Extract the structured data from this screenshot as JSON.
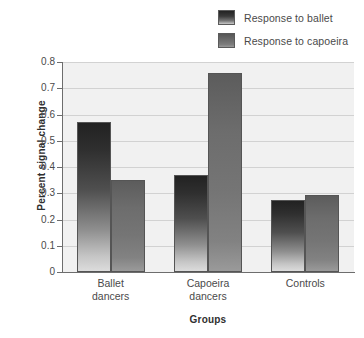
{
  "chart_data": {
    "type": "bar",
    "title": "",
    "xlabel": "Groups",
    "ylabel": "Percent signal change",
    "categories": [
      "Ballet dancers",
      "Capoeira dancers",
      "Controls"
    ],
    "category_lines": [
      [
        "Ballet",
        "dancers"
      ],
      [
        "Capoeira",
        "dancers"
      ],
      [
        "Controls"
      ]
    ],
    "series": [
      {
        "name": "Response to ballet",
        "values": [
          0.57,
          0.37,
          0.275
        ],
        "color": "#2f2f2f"
      },
      {
        "name": "Response to capoeira",
        "values": [
          0.35,
          0.76,
          0.295
        ],
        "color": "#6e6e6e"
      }
    ],
    "ylim": [
      0,
      0.8
    ],
    "yticks": [
      0,
      0.1,
      0.2,
      0.3,
      0.4,
      0.5,
      0.6,
      0.7,
      0.8
    ],
    "ytick_labels": [
      "0",
      "0.1",
      "0.2",
      "0.3",
      "0.4",
      "0.5",
      "0.6",
      "0.7",
      "0.8"
    ],
    "grid": true,
    "legend_position": "top-right",
    "plot_background": "#f1f1f1",
    "gridline_color": "#d2d2d2",
    "axis_color": "#6d6d6d"
  },
  "legend": {
    "entries": [
      {
        "label": "Response to ballet"
      },
      {
        "label": "Response to capoeira"
      }
    ]
  }
}
